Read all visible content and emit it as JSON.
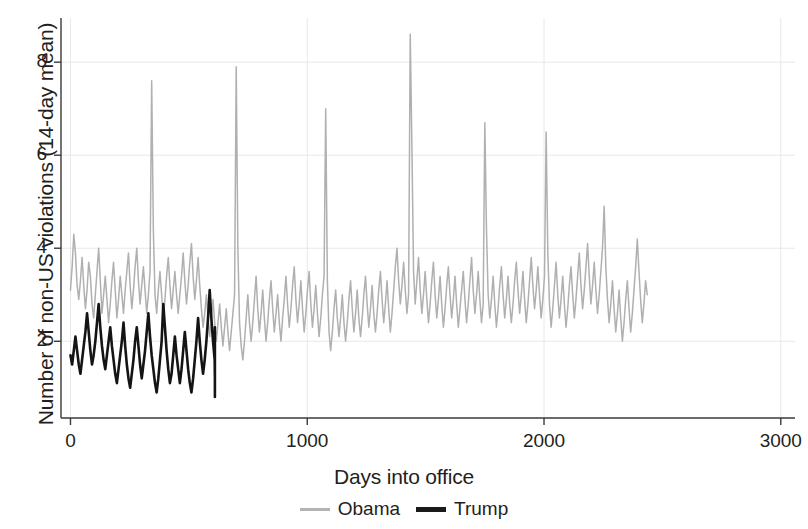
{
  "chart_data": {
    "type": "line",
    "title": "",
    "xlabel": "Days into office",
    "ylabel": "Number of non-US violations (14-day mean)",
    "xlim": [
      -40,
      3060
    ],
    "ylim": [
      0.35,
      8.95
    ],
    "xticks": [
      0,
      1000,
      2000,
      3000
    ],
    "xtick_labels": [
      "0",
      "1000",
      "2000",
      "3000"
    ],
    "yticks": [
      2,
      4,
      6,
      8
    ],
    "ytick_labels": [
      "2",
      "4",
      "6",
      "8"
    ],
    "grid": true,
    "grid_color": "#e8e8e8",
    "legend_position": "below",
    "colors": {
      "obama": "#b0b0b0",
      "trump": "#141414",
      "axis": "#3a3a3a",
      "text": "#231f20"
    },
    "series": [
      {
        "name": "Obama",
        "color": "#b0b0b0",
        "x_start": 0,
        "x_end": 2940,
        "x_step": 7,
        "values": [
          3.1,
          3.6,
          4.3,
          3.9,
          3.2,
          2.9,
          3.3,
          3.8,
          3.2,
          2.7,
          3.1,
          3.7,
          3.4,
          2.8,
          2.5,
          3.0,
          3.5,
          4.0,
          3.3,
          2.6,
          3.0,
          3.4,
          2.9,
          2.4,
          2.8,
          3.3,
          3.7,
          3.1,
          2.5,
          2.9,
          3.4,
          3.0,
          2.6,
          3.1,
          3.5,
          3.9,
          3.2,
          2.7,
          3.1,
          3.6,
          4.0,
          3.3,
          2.8,
          3.2,
          3.6,
          3.1,
          2.6,
          3.0,
          3.5,
          7.6,
          4.4,
          3.0,
          2.6,
          3.1,
          3.5,
          3.0,
          2.5,
          2.9,
          3.4,
          3.8,
          3.2,
          2.7,
          3.1,
          3.5,
          3.0,
          2.6,
          3.0,
          3.4,
          3.9,
          3.3,
          2.8,
          3.2,
          3.7,
          4.1,
          3.4,
          2.9,
          3.3,
          3.8,
          3.2,
          2.7,
          2.3,
          2.6,
          3.0,
          2.5,
          2.1,
          2.5,
          2.9,
          2.4,
          2.0,
          2.4,
          2.8,
          2.3,
          1.9,
          2.3,
          2.7,
          2.2,
          1.8,
          2.2,
          2.6,
          3.0,
          7.9,
          4.0,
          2.4,
          1.9,
          1.6,
          2.0,
          2.5,
          3.0,
          2.4,
          2.0,
          2.4,
          2.9,
          3.4,
          2.7,
          2.2,
          2.6,
          3.1,
          2.5,
          2.0,
          2.4,
          2.9,
          3.3,
          2.7,
          2.2,
          2.6,
          3.0,
          2.4,
          2.0,
          2.5,
          2.9,
          3.4,
          2.8,
          2.3,
          2.7,
          3.2,
          3.6,
          2.9,
          2.4,
          2.8,
          3.3,
          2.7,
          2.2,
          2.6,
          3.1,
          3.5,
          2.8,
          2.3,
          2.7,
          3.2,
          2.6,
          2.1,
          2.5,
          3.0,
          3.4,
          7.0,
          3.3,
          2.2,
          1.8,
          2.2,
          2.7,
          3.1,
          2.5,
          2.1,
          2.5,
          3.0,
          2.4,
          2.0,
          2.4,
          2.9,
          3.3,
          2.7,
          2.2,
          2.6,
          3.1,
          2.5,
          2.1,
          2.5,
          3.0,
          3.4,
          2.8,
          2.3,
          2.7,
          3.2,
          2.6,
          2.2,
          2.6,
          3.1,
          3.5,
          2.9,
          2.4,
          2.8,
          3.3,
          2.7,
          2.2,
          2.6,
          3.1,
          3.6,
          4.0,
          3.3,
          2.8,
          3.2,
          3.7,
          3.1,
          2.6,
          3.0,
          8.6,
          6.2,
          3.5,
          2.8,
          3.3,
          3.8,
          3.1,
          2.6,
          3.0,
          3.5,
          2.9,
          2.4,
          2.8,
          3.3,
          3.7,
          3.0,
          2.5,
          2.9,
          3.4,
          2.8,
          2.3,
          2.7,
          3.2,
          3.6,
          3.0,
          2.5,
          2.9,
          3.4,
          2.8,
          2.3,
          2.7,
          3.1,
          3.5,
          2.9,
          2.4,
          2.8,
          3.3,
          3.8,
          3.1,
          2.6,
          3.0,
          3.5,
          2.9,
          2.4,
          2.8,
          6.7,
          4.4,
          3.0,
          2.5,
          2.9,
          3.4,
          2.8,
          2.3,
          2.7,
          3.2,
          3.6,
          3.0,
          2.5,
          2.9,
          3.4,
          2.8,
          2.4,
          2.8,
          3.3,
          3.7,
          3.1,
          2.6,
          3.0,
          3.5,
          2.9,
          2.4,
          2.8,
          3.3,
          3.8,
          3.2,
          2.7,
          3.1,
          3.6,
          3.0,
          2.5,
          2.9,
          3.4,
          6.5,
          3.9,
          2.8,
          2.3,
          2.7,
          3.2,
          3.7,
          3.0,
          2.5,
          2.9,
          3.4,
          2.8,
          2.3,
          2.7,
          3.2,
          3.6,
          3.0,
          2.5,
          2.9,
          3.4,
          3.9,
          3.2,
          2.7,
          3.1,
          3.6,
          4.1,
          3.4,
          2.8,
          3.2,
          3.7,
          3.1,
          2.6,
          3.0,
          3.5,
          4.0,
          4.9,
          3.6,
          2.9,
          2.4,
          2.8,
          3.3,
          2.7,
          2.2,
          2.6,
          3.1,
          2.5,
          2.0,
          2.4,
          2.9,
          3.3,
          2.7,
          2.2,
          2.6,
          3.1,
          3.6,
          4.2,
          3.5,
          2.9,
          2.4,
          2.8,
          3.3,
          3.0
        ]
      },
      {
        "name": "Trump",
        "color": "#141414",
        "x_start": 0,
        "x_end": 610,
        "x_step": 7,
        "values": [
          1.7,
          1.5,
          1.8,
          2.1,
          1.8,
          1.5,
          1.3,
          1.6,
          1.9,
          2.2,
          2.6,
          2.2,
          1.8,
          1.5,
          1.7,
          2.0,
          2.4,
          2.8,
          2.3,
          1.9,
          1.6,
          1.4,
          1.7,
          2.0,
          2.3,
          1.9,
          1.6,
          1.3,
          1.1,
          1.4,
          1.7,
          2.0,
          2.4,
          1.9,
          1.5,
          1.2,
          1.0,
          1.3,
          1.6,
          2.0,
          2.3,
          1.9,
          1.5,
          1.2,
          1.5,
          1.8,
          2.2,
          2.6,
          2.1,
          1.7,
          1.4,
          1.1,
          0.9,
          1.2,
          1.6,
          2.0,
          2.8,
          2.3,
          1.8,
          1.4,
          1.1,
          1.3,
          1.7,
          2.1,
          1.7,
          1.4,
          1.1,
          1.4,
          1.8,
          2.2,
          1.8,
          1.4,
          1.1,
          0.9,
          1.2,
          1.6,
          2.0,
          2.5,
          2.0,
          1.6,
          1.3,
          1.6,
          2.0,
          2.5,
          3.1,
          2.5,
          2.0,
          1.6,
          1.2,
          1.5,
          1.9,
          2.3,
          1.8,
          1.4,
          1.1,
          1.0,
          1.3,
          1.6,
          1.3,
          1.0,
          0.8
        ]
      }
    ]
  },
  "axis": {
    "x_label": "Days into office",
    "y_label": "Number of non-US violations (14-day mean)"
  },
  "legend": {
    "entries": [
      {
        "label": "Obama",
        "swatch": "obama-line-swatch"
      },
      {
        "label": "Trump",
        "swatch": "trump-line-swatch"
      }
    ]
  }
}
